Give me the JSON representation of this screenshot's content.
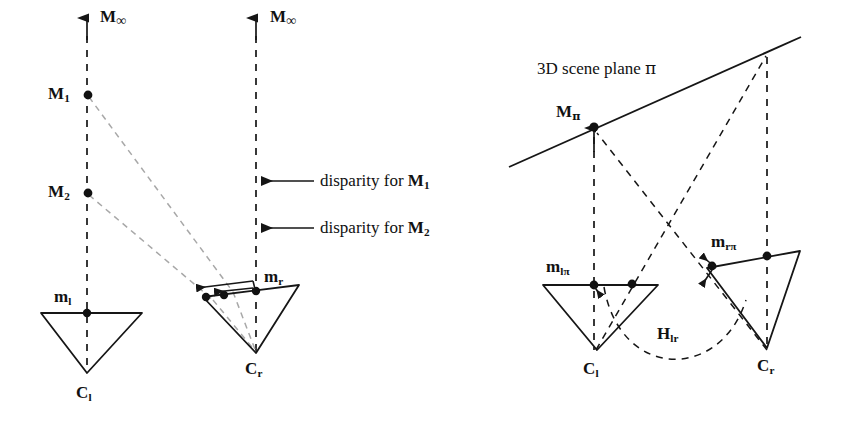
{
  "figure": {
    "background_color": "#ffffff",
    "stroke_color": "#1a1a1a",
    "faint_stroke_color": "#9a9a9a",
    "width": 848,
    "height": 431
  },
  "left_panel": {
    "name": "disparity-diagram",
    "labels": {
      "m_inf_left": "M",
      "m_inf_left_sub": "∞",
      "m_inf_right": "M",
      "m_inf_right_sub": "∞",
      "point_M1": "M",
      "point_M1_sub": "1",
      "point_M2": "M",
      "point_M2_sub": "2",
      "image_point_ml": "m",
      "image_point_ml_sub": "l",
      "image_point_mr": "m",
      "image_point_mr_sub": "r",
      "camera_Cl": "C",
      "camera_Cl_sub": "l",
      "camera_Cr": "C",
      "camera_Cr_sub": "r",
      "disparity_1": "disparity for",
      "disparity_1_sym": "M",
      "disparity_1_sub": "1",
      "disparity_2": "disparity for",
      "disparity_2_sym": "M",
      "disparity_2_sub": "2"
    }
  },
  "right_panel": {
    "name": "homography-diagram",
    "labels": {
      "scene_plane": "3D scene plane",
      "scene_plane_sym": "π",
      "point_Mpi": "M",
      "point_Mpi_sub": "π",
      "image_point_mlpi": "m",
      "image_point_mlpi_sub": "lπ",
      "image_point_mrpi": "m",
      "image_point_mrpi_sub": "rπ",
      "homography": "H",
      "homography_sub": "lr",
      "camera_Cl": "C",
      "camera_Cl_sub": "l",
      "camera_Cr": "C",
      "camera_Cr_sub": "r"
    }
  }
}
